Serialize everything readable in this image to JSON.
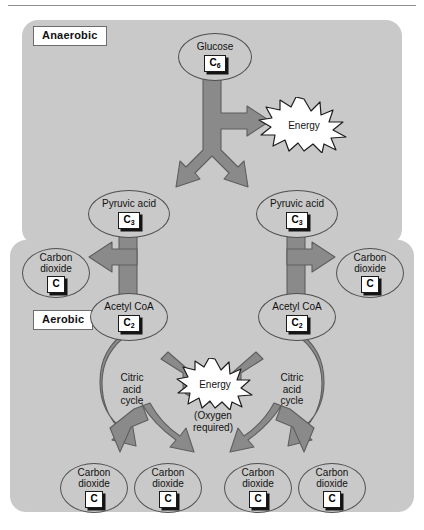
{
  "diagram": {
    "sections": [
      {
        "id": "anaerobic",
        "label": "Anaerobic"
      },
      {
        "id": "aerobic",
        "label": "Aerobic"
      }
    ],
    "colors": {
      "panel_background": "#c9c9c9",
      "arrow_fill": "#8a8a8a",
      "arrow_stroke": "#5e5e5e",
      "node_border": "#4f4f4f",
      "box_background": "#ffffff",
      "box_shadow": "#141414",
      "page_background": "#ffffff"
    },
    "nodes": {
      "glucose": {
        "label": "Glucose",
        "formula": "C",
        "carbons": "6"
      },
      "pyruvic_left": {
        "label": "Pyruvic acid",
        "formula": "C",
        "carbons": "3"
      },
      "pyruvic_right": {
        "label": "Pyruvic acid",
        "formula": "C",
        "carbons": "3"
      },
      "acetyl_left": {
        "label": "Acetyl CoA",
        "formula": "C",
        "carbons": "2"
      },
      "acetyl_right": {
        "label": "Acetyl CoA",
        "formula": "C",
        "carbons": "2"
      },
      "co2_upper_left": {
        "line1": "Carbon",
        "line2": "dioxide",
        "formula": "C",
        "carbons": ""
      },
      "co2_upper_right": {
        "line1": "Carbon",
        "line2": "dioxide",
        "formula": "C",
        "carbons": ""
      },
      "co2_b1": {
        "line1": "Carbon",
        "line2": "dioxide",
        "formula": "C",
        "carbons": ""
      },
      "co2_b2": {
        "line1": "Carbon",
        "line2": "dioxide",
        "formula": "C",
        "carbons": ""
      },
      "co2_b3": {
        "line1": "Carbon",
        "line2": "dioxide",
        "formula": "C",
        "carbons": ""
      },
      "co2_b4": {
        "line1": "Carbon",
        "line2": "dioxide",
        "formula": "C",
        "carbons": ""
      }
    },
    "cycles": {
      "left": {
        "line1": "Citric",
        "line2": "acid",
        "line3": "cycle"
      },
      "right": {
        "line1": "Citric",
        "line2": "acid",
        "line3": "cycle"
      }
    },
    "energy": {
      "anaerobic_burst": "Energy",
      "aerobic_burst": "Energy",
      "oxygen_note_line1": "(Oxygen",
      "oxygen_note_line2": "required)"
    }
  }
}
